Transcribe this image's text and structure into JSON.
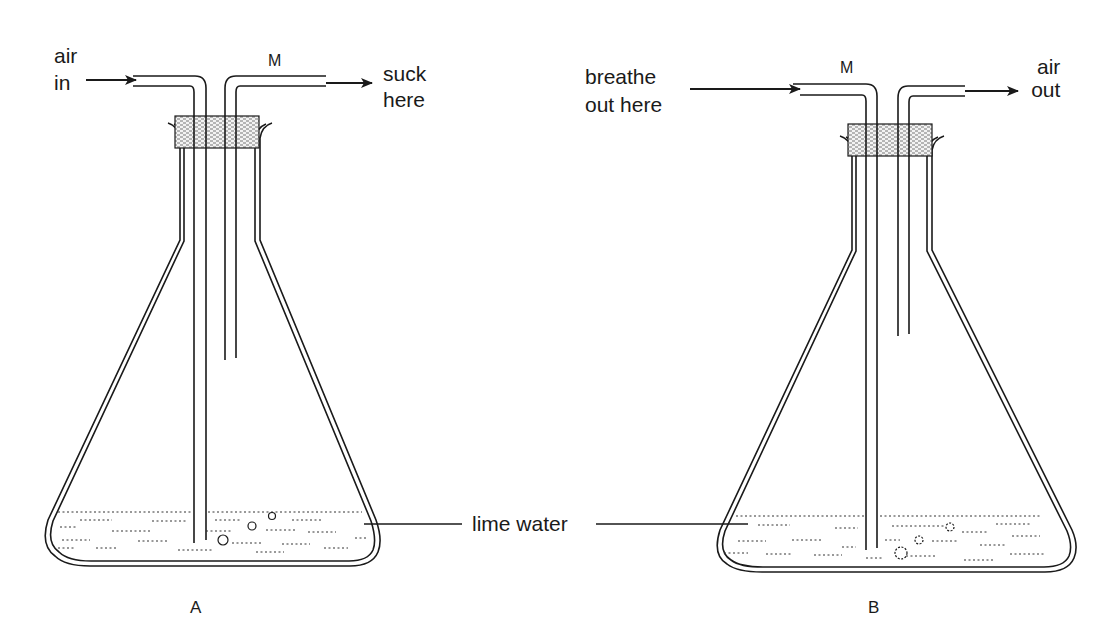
{
  "figure": {
    "colors": {
      "ink": "#1a1a1a",
      "background": "#ffffff"
    }
  },
  "flask_a": {
    "caption": "A",
    "tube_label": "M",
    "inlet_label_line1": "air",
    "inlet_label_line2": "in",
    "outlet_label_line1": "suck",
    "outlet_label_line2": "here",
    "long_tube": "inlet",
    "short_tube": "outlet"
  },
  "flask_b": {
    "caption": "B",
    "tube_label": "M",
    "inlet_label_line1": "breathe",
    "inlet_label_line2": "out here",
    "outlet_label_line1": "air",
    "outlet_label_line2": "out",
    "long_tube": "inlet",
    "short_tube": "outlet"
  },
  "shared": {
    "liquid_label": "lime water"
  }
}
